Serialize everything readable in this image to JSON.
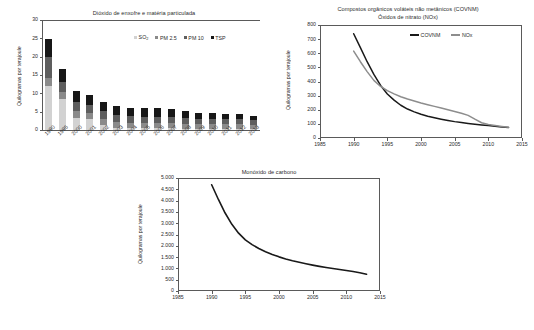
{
  "figure": {
    "background": "#ffffff",
    "axis_color": "#5a5a5a",
    "text_color": "#2b2b2b"
  },
  "chart_data": [
    {
      "id": "sulfur-dioxide-particulate-matter",
      "type": "bar",
      "stacked": true,
      "title": "Dióxido de enxofre e matéria particulada",
      "xlabel": "",
      "ylabel": "Quilogramas por terajoule",
      "ylim": [
        0,
        30
      ],
      "yticks": [
        0,
        5,
        10,
        15,
        20,
        25,
        30
      ],
      "ytick_labels": [
        "0",
        "5",
        "10",
        "15",
        "20",
        "25",
        "30"
      ],
      "grid": false,
      "legend_position": "top-right",
      "categories": [
        "1990",
        "1995",
        "2000",
        "2001",
        "2002",
        "2003",
        "2004",
        "2005",
        "2006",
        "2007",
        "2008",
        "2009",
        "2010",
        "2011",
        "2012",
        "2013"
      ],
      "series": [
        {
          "name": "SO₂",
          "legend_label": "SO2",
          "color": "#d2d2d2",
          "values": [
            11.9,
            8.4,
            3.4,
            2.9,
            1.4,
            0.6,
            0.5,
            0.5,
            0.5,
            0.5,
            0.4,
            0.4,
            0.4,
            0.4,
            0.4,
            0.3
          ]
        },
        {
          "name": "PM 2.5",
          "legend_label": "PM 2.5",
          "color": "#8a8a8a",
          "values": [
            2.4,
            1.9,
            1.9,
            1.8,
            1.6,
            1.5,
            1.5,
            1.4,
            1.4,
            1.4,
            1.3,
            1.2,
            1.2,
            1.2,
            1.2,
            1.1
          ]
        },
        {
          "name": "PM 10",
          "legend_label": "PM 10",
          "color": "#5e5e5e",
          "values": [
            5.6,
            2.8,
            2.4,
            2.2,
            2.1,
            1.9,
            1.7,
            1.7,
            1.7,
            1.6,
            1.6,
            1.5,
            1.4,
            1.4,
            1.3,
            1.2
          ]
        },
        {
          "name": "TSP",
          "legend_label": "TSP",
          "color": "#171717",
          "values": [
            4.9,
            3.6,
            3.0,
            2.6,
            2.6,
            2.5,
            2.4,
            2.3,
            2.3,
            2.2,
            1.9,
            1.6,
            1.6,
            1.5,
            1.4,
            1.3
          ]
        }
      ]
    },
    {
      "id": "covnm-nox",
      "type": "line",
      "title_line1": "Compostos orgânicos voláteis não metânicos (COVNM)",
      "title_line2": "Óxidos de nitrato (NOx)",
      "xlabel": "",
      "ylabel": "Quilogramas por terajoule",
      "xlim": [
        1985,
        2015
      ],
      "ylim": [
        0,
        800
      ],
      "xticks": [
        1985,
        1990,
        1995,
        2000,
        2005,
        2010,
        2015
      ],
      "xtick_labels": [
        "1985",
        "1990",
        "1995",
        "2000",
        "2005",
        "2010",
        "2015"
      ],
      "yticks": [
        0,
        100,
        200,
        300,
        400,
        500,
        600,
        700,
        800
      ],
      "ytick_labels": [
        "0",
        "100",
        "200",
        "300",
        "400",
        "500",
        "600",
        "700",
        "800"
      ],
      "grid": false,
      "legend_position": "top-center",
      "series": [
        {
          "name": "COVNM",
          "color": "#191919",
          "width": 1.5,
          "x": [
            1990,
            1991,
            1992,
            1993,
            1994,
            1995,
            1996,
            1997,
            1998,
            1999,
            2000,
            2001,
            2002,
            2003,
            2004,
            2005,
            2006,
            2007,
            2008,
            2009,
            2010,
            2011,
            2012,
            2013
          ],
          "y": [
            738,
            640,
            540,
            450,
            372,
            312,
            268,
            232,
            205,
            185,
            168,
            154,
            143,
            133,
            124,
            116,
            109,
            103,
            97,
            92,
            88,
            83,
            78,
            74
          ]
        },
        {
          "name": "NOx",
          "color": "#8d8d8d",
          "width": 1.5,
          "x": [
            1990,
            1991,
            1992,
            1993,
            1994,
            1995,
            1996,
            1997,
            1998,
            1999,
            2000,
            2001,
            2002,
            2003,
            2004,
            2005,
            2006,
            2007,
            2008,
            2009,
            2010,
            2011,
            2012,
            2013
          ],
          "y": [
            615,
            540,
            470,
            408,
            365,
            335,
            312,
            292,
            276,
            262,
            248,
            236,
            224,
            212,
            200,
            188,
            175,
            160,
            133,
            108,
            95,
            88,
            82,
            76
          ]
        }
      ]
    },
    {
      "id": "carbon-monoxide",
      "type": "line",
      "title": "Monóxido de carbono",
      "xlabel": "",
      "ylabel": "Quilogramas por terajoule",
      "xlim": [
        1985,
        2015
      ],
      "ylim": [
        0,
        5000
      ],
      "xticks": [
        1985,
        1990,
        1995,
        2000,
        2005,
        2010,
        2015
      ],
      "xtick_labels": [
        "1985",
        "1990",
        "1995",
        "2000",
        "2005",
        "2010",
        "2015"
      ],
      "yticks": [
        0,
        500,
        1000,
        1500,
        2000,
        2500,
        3000,
        3500,
        4000,
        4500,
        5000
      ],
      "ytick_labels": [
        "0",
        "500",
        "1.000",
        "1.500",
        "2.000",
        "2.500",
        "3.000",
        "3.500",
        "4.000",
        "4.500",
        "5.000"
      ],
      "grid": false,
      "series": [
        {
          "name": "Monóxido de carbono",
          "color": "#191919",
          "width": 1.6,
          "x": [
            1990,
            1991,
            1992,
            1993,
            1994,
            1995,
            1996,
            1997,
            1998,
            1999,
            2000,
            2001,
            2002,
            2003,
            2004,
            2005,
            2006,
            2007,
            2008,
            2009,
            2010,
            2011,
            2012,
            2013
          ],
          "y": [
            4700,
            4050,
            3450,
            2950,
            2560,
            2260,
            2050,
            1880,
            1740,
            1620,
            1510,
            1420,
            1340,
            1270,
            1205,
            1145,
            1090,
            1040,
            995,
            950,
            905,
            860,
            810,
            740
          ]
        }
      ]
    }
  ],
  "caption": ""
}
